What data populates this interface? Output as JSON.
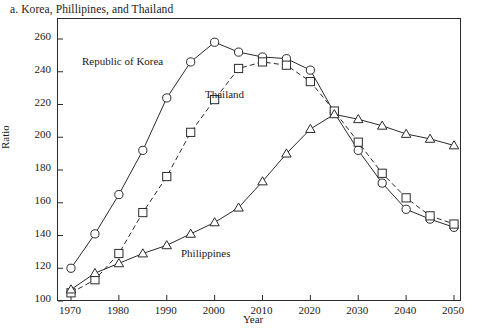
{
  "chart_data": {
    "type": "line",
    "title": "a. Korea, Phillipines, and Thailand",
    "xlabel": "Year",
    "ylabel": "Ratio",
    "xlim": [
      1970,
      2050
    ],
    "ylim": [
      100,
      260
    ],
    "xticks": [
      1970,
      1980,
      1990,
      2000,
      2010,
      2020,
      2030,
      2040,
      2050
    ],
    "yticks": [
      100,
      120,
      140,
      160,
      180,
      200,
      220,
      240,
      260
    ],
    "grid": false,
    "legend_position": "inline-annotations",
    "x": [
      1970,
      1975,
      1980,
      1985,
      1990,
      1995,
      2000,
      2005,
      2010,
      2015,
      2020,
      2025,
      2030,
      2035,
      2040,
      2045,
      2050
    ],
    "series": [
      {
        "name": "Republic of Korea",
        "marker": "circle",
        "linestyle": "solid",
        "color": "#2b2b2b",
        "values": [
          120,
          141,
          165,
          192,
          224,
          246,
          258,
          252,
          249,
          248,
          241,
          215,
          192,
          172,
          156,
          150,
          145
        ]
      },
      {
        "name": "Thailand",
        "marker": "square",
        "linestyle": "dashed",
        "color": "#2b2b2b",
        "values": [
          105,
          113,
          129,
          154,
          176,
          203,
          223,
          242,
          246,
          244,
          234,
          216,
          197,
          178,
          163,
          152,
          147
        ]
      },
      {
        "name": "Philippines",
        "marker": "triangle",
        "linestyle": "solid",
        "color": "#2b2b2b",
        "values": [
          107,
          117,
          123,
          129,
          134,
          141,
          148,
          157,
          173,
          190,
          205,
          214,
          211,
          207,
          202,
          199,
          195
        ]
      }
    ]
  },
  "annotations": {
    "korea": "Republic of Korea",
    "thailand": "Thailand",
    "philippines": "Philippines"
  }
}
